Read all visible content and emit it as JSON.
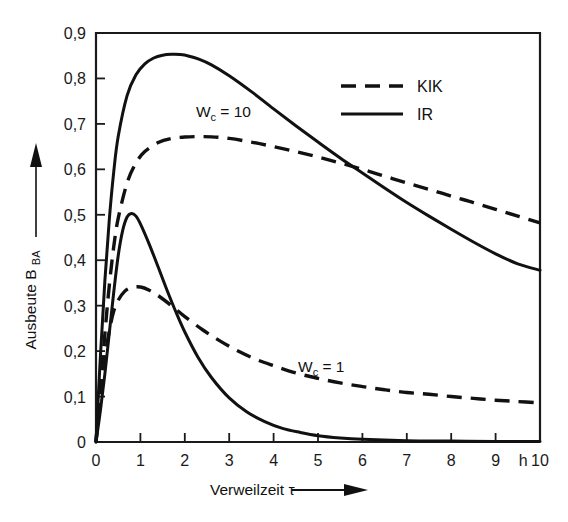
{
  "chart_data": {
    "type": "line",
    "title": "",
    "xlabel": "Verweilzeit τ",
    "ylabel": "Ausbeute B",
    "ylabel_sub": "BA",
    "xunit": "h",
    "xlim": [
      0,
      10
    ],
    "ylim": [
      0,
      0.9
    ],
    "grid": false,
    "legend_position": "top-right",
    "xticks": [
      "0",
      "1",
      "2",
      "3",
      "4",
      "5",
      "6",
      "7",
      "8",
      "9",
      "10"
    ],
    "xtick_values": [
      0,
      1,
      2,
      3,
      4,
      5,
      6,
      7,
      8,
      9,
      10
    ],
    "yticks": [
      "0",
      "0,1",
      "0,2",
      "0,3",
      "0,4",
      "0,5",
      "0,6",
      "0,7",
      "0,8",
      "0,9"
    ],
    "ytick_values": [
      0,
      0.1,
      0.2,
      0.3,
      0.4,
      0.5,
      0.6,
      0.7,
      0.8,
      0.9
    ],
    "legend": [
      {
        "name": "KIK",
        "style": "dashed"
      },
      {
        "name": "IR",
        "style": "solid"
      }
    ],
    "annotations": [
      {
        "text": "W",
        "sub": "c",
        "suffix": " = 10",
        "x": 2.25,
        "y": 0.715
      },
      {
        "text": "W",
        "sub": "c",
        "suffix": " = 1",
        "x": 4.55,
        "y": 0.155
      }
    ],
    "series": [
      {
        "name": "IR, Wc = 10",
        "style": "solid",
        "label": "W_c = 10",
        "x": [
          0,
          0.1,
          0.2,
          0.3,
          0.4,
          0.5,
          0.7,
          0.9,
          1.1,
          1.3,
          1.5,
          1.7,
          1.9,
          2.1,
          2.3,
          2.6,
          3.0,
          3.5,
          4.0,
          4.5,
          5.0,
          5.5,
          6.0,
          6.5,
          7.0,
          7.5,
          8.0,
          8.5,
          9.0,
          9.5,
          10.0
        ],
        "y": [
          0,
          0.19,
          0.355,
          0.49,
          0.595,
          0.672,
          0.762,
          0.808,
          0.832,
          0.845,
          0.851,
          0.853,
          0.8525,
          0.849,
          0.843,
          0.83,
          0.806,
          0.771,
          0.733,
          0.696,
          0.66,
          0.625,
          0.592,
          0.559,
          0.527,
          0.497,
          0.468,
          0.44,
          0.414,
          0.392,
          0.378
        ]
      },
      {
        "name": "KIK, Wc = 10",
        "style": "dashed",
        "label": "W_c = 10",
        "x": [
          0,
          0.1,
          0.2,
          0.3,
          0.4,
          0.5,
          0.7,
          0.9,
          1.1,
          1.4,
          1.7,
          2.0,
          2.3,
          2.6,
          3.0,
          3.5,
          4.0,
          4.5,
          5.0,
          5.5,
          6.0,
          6.5,
          7.0,
          7.5,
          8.0,
          8.5,
          9.0,
          9.5,
          10.0
        ],
        "y": [
          0,
          0.12,
          0.238,
          0.345,
          0.43,
          0.492,
          0.57,
          0.614,
          0.639,
          0.659,
          0.668,
          0.671,
          0.672,
          0.6715,
          0.668,
          0.66,
          0.65,
          0.639,
          0.627,
          0.614,
          0.6,
          0.585,
          0.57,
          0.556,
          0.541,
          0.527,
          0.512,
          0.497,
          0.482
        ]
      },
      {
        "name": "IR, Wc = 1",
        "style": "solid",
        "label": "W_c = 1",
        "x": [
          0,
          0.1,
          0.2,
          0.3,
          0.4,
          0.5,
          0.6,
          0.7,
          0.8,
          0.9,
          1.0,
          1.2,
          1.4,
          1.6,
          1.8,
          2.0,
          2.3,
          2.6,
          3.0,
          3.4,
          3.8,
          4.2,
          4.6,
          5.0,
          5.5,
          6.0,
          7.0,
          8.0,
          9.0,
          10.0
        ],
        "y": [
          0,
          0.07,
          0.15,
          0.24,
          0.33,
          0.41,
          0.465,
          0.495,
          0.503,
          0.497,
          0.48,
          0.435,
          0.385,
          0.334,
          0.286,
          0.242,
          0.186,
          0.142,
          0.097,
          0.066,
          0.045,
          0.03,
          0.021,
          0.014,
          0.009,
          0.006,
          0.003,
          0.002,
          0.001,
          0.001
        ]
      },
      {
        "name": "KIK, Wc = 1",
        "style": "dashed",
        "label": "W_c = 1",
        "x": [
          0,
          0.1,
          0.2,
          0.3,
          0.4,
          0.5,
          0.65,
          0.8,
          1.0,
          1.2,
          1.4,
          1.7,
          2.0,
          2.4,
          2.8,
          3.2,
          3.6,
          4.0,
          4.5,
          5.0,
          5.5,
          6.0,
          6.5,
          7.0,
          7.5,
          8.0,
          8.5,
          9.0,
          9.5,
          10.0
        ],
        "y": [
          0,
          0.105,
          0.185,
          0.245,
          0.288,
          0.312,
          0.332,
          0.34,
          0.341,
          0.334,
          0.322,
          0.3,
          0.276,
          0.247,
          0.222,
          0.2,
          0.182,
          0.168,
          0.152,
          0.14,
          0.13,
          0.122,
          0.115,
          0.109,
          0.105,
          0.1,
          0.096,
          0.092,
          0.089,
          0.086
        ]
      }
    ]
  }
}
